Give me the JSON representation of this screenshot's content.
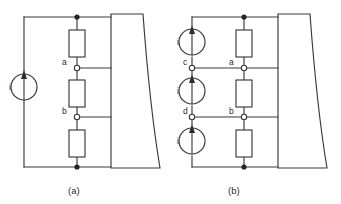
{
  "figure": {
    "type": "circuit-diagram",
    "background_color": "#ffffff",
    "line_color": "#3a3a3a"
  },
  "panels": [
    {
      "id": "a",
      "caption": "(a)",
      "sources": [
        {
          "label": "i",
          "direction": "up"
        }
      ],
      "resistors": [
        {
          "name": "r-top"
        },
        {
          "name": "r-middle"
        },
        {
          "name": "r-bottom"
        }
      ],
      "nodes": [
        {
          "label": "a",
          "style": "open"
        },
        {
          "label": "b",
          "style": "open"
        },
        {
          "label": "",
          "style": "solid"
        },
        {
          "label": "",
          "style": "solid"
        }
      ],
      "network_block": {
        "name": "network-block",
        "label": ""
      }
    },
    {
      "id": "b",
      "caption": "(b)",
      "sources": [
        {
          "label": "i",
          "direction": "up"
        },
        {
          "label": "i",
          "direction": "up"
        },
        {
          "label": "i",
          "direction": "up"
        }
      ],
      "resistors": [
        {
          "name": "r-top"
        },
        {
          "name": "r-middle"
        },
        {
          "name": "r-bottom"
        }
      ],
      "nodes": [
        {
          "label": "c",
          "style": "open"
        },
        {
          "label": "d",
          "style": "open"
        },
        {
          "label": "a",
          "style": "open"
        },
        {
          "label": "b",
          "style": "open"
        },
        {
          "label": "",
          "style": "solid"
        },
        {
          "label": "",
          "style": "solid"
        }
      ],
      "network_block": {
        "name": "network-block",
        "label": ""
      }
    }
  ]
}
